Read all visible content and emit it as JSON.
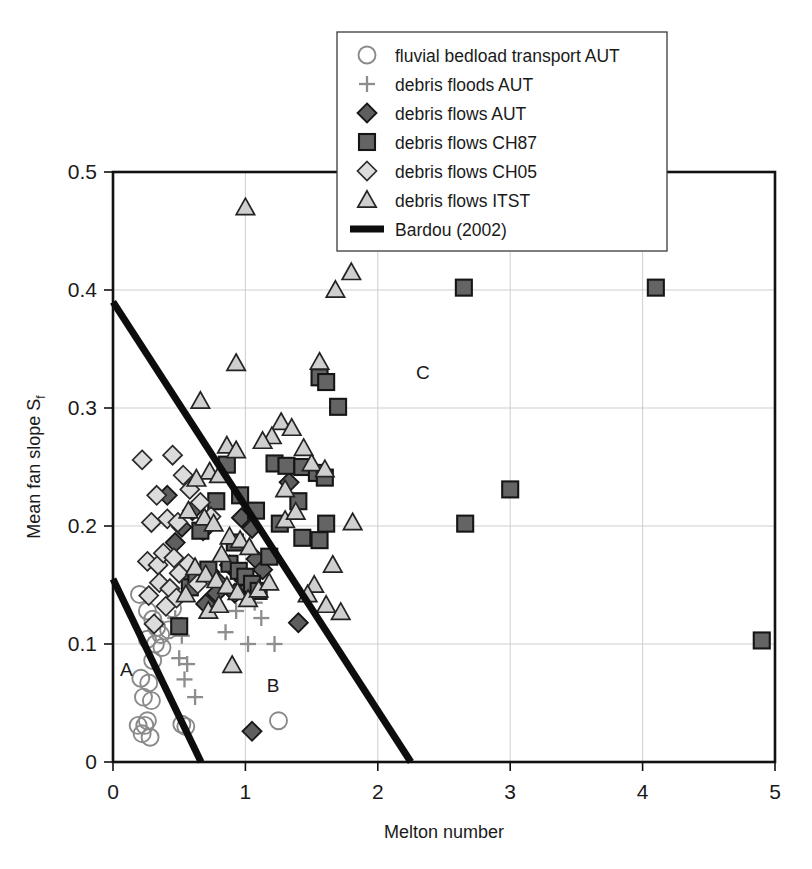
{
  "chart_data": {
    "type": "scatter",
    "title": "",
    "xlabel": "Melton number",
    "ylabel": "Mean fan slope S_f",
    "ylabel_main": "Mean fan slope S",
    "ylabel_sub": "f",
    "xlim": [
      0,
      5
    ],
    "ylim": [
      0,
      0.5
    ],
    "xticks": [
      "0",
      "1",
      "2",
      "3",
      "4",
      "5"
    ],
    "xtick_values": [
      0,
      1,
      2,
      3,
      4,
      5
    ],
    "yticks": [
      "0",
      "0.1",
      "0.2",
      "0.3",
      "0.4",
      "0.5"
    ],
    "ytick_values": [
      0,
      0.1,
      0.2,
      0.3,
      0.4,
      0.5
    ],
    "grid": true,
    "legend_position": "top-center",
    "annotations": [
      {
        "text": "A",
        "x": 0.1,
        "y": 0.073
      },
      {
        "text": "B",
        "x": 1.21,
        "y": 0.059
      },
      {
        "text": "C",
        "x": 2.34,
        "y": 0.325
      }
    ],
    "legend": [
      {
        "label": "fluvial bedload transport AUT",
        "marker": "circle-open-gray",
        "series": "fluvial_bedload_AUT"
      },
      {
        "label": "debris floods AUT",
        "marker": "plus-gray",
        "series": "debris_floods_AUT"
      },
      {
        "label": "debris flows AUT",
        "marker": "diamond-dark",
        "series": "debris_flows_AUT"
      },
      {
        "label": "debris flows CH87",
        "marker": "square-dark",
        "series": "debris_flows_CH87"
      },
      {
        "label": "debris flows CH05",
        "marker": "diamond-light",
        "series": "debris_flows_CH05"
      },
      {
        "label": "debris flows ITST",
        "marker": "triangle-light",
        "series": "debris_flows_ITST"
      },
      {
        "label": "Bardou (2002)",
        "marker": "thick-line",
        "series": "bardou_2002"
      }
    ],
    "lines": [
      {
        "name": "Bardou (2002) upper",
        "points": [
          [
            0.0,
            0.39
          ],
          [
            2.25,
            0.0
          ]
        ]
      },
      {
        "name": "Bardou (2002) lower",
        "points": [
          [
            0.0,
            0.155
          ],
          [
            0.665,
            0.0
          ]
        ]
      }
    ],
    "series": [
      {
        "name": "fluvial bedload transport AUT",
        "marker": "circle-open-gray",
        "points": [
          [
            0.2,
            0.142
          ],
          [
            0.26,
            0.128
          ],
          [
            0.3,
            0.121
          ],
          [
            0.33,
            0.114
          ],
          [
            0.36,
            0.108
          ],
          [
            0.26,
            0.104
          ],
          [
            0.32,
            0.1
          ],
          [
            0.37,
            0.097
          ],
          [
            0.3,
            0.086
          ],
          [
            0.21,
            0.071
          ],
          [
            0.27,
            0.067
          ],
          [
            0.23,
            0.055
          ],
          [
            0.29,
            0.052
          ],
          [
            0.19,
            0.031
          ],
          [
            0.24,
            0.031
          ],
          [
            0.26,
            0.035
          ],
          [
            0.22,
            0.024
          ],
          [
            0.28,
            0.021
          ],
          [
            0.52,
            0.032
          ],
          [
            0.55,
            0.03
          ],
          [
            1.25,
            0.035
          ],
          [
            0.42,
            0.112
          ],
          [
            0.45,
            0.13
          ]
        ]
      },
      {
        "name": "debris floods AUT",
        "marker": "plus-gray",
        "points": [
          [
            0.47,
            0.122
          ],
          [
            0.52,
            0.107
          ],
          [
            0.5,
            0.088
          ],
          [
            0.56,
            0.083
          ],
          [
            0.54,
            0.07
          ],
          [
            0.62,
            0.055
          ],
          [
            0.85,
            0.11
          ],
          [
            0.93,
            0.128
          ],
          [
            1.02,
            0.1
          ],
          [
            1.12,
            0.122
          ],
          [
            1.22,
            0.1
          ],
          [
            1.07,
            0.135
          ]
        ]
      },
      {
        "name": "debris flows AUT",
        "marker": "diamond-dark",
        "points": [
          [
            0.41,
            0.226
          ],
          [
            0.47,
            0.186
          ],
          [
            0.55,
            0.161
          ],
          [
            0.62,
            0.152
          ],
          [
            0.52,
            0.199
          ],
          [
            0.6,
            0.213
          ],
          [
            0.68,
            0.196
          ],
          [
            0.73,
            0.161
          ],
          [
            0.8,
            0.152
          ],
          [
            0.88,
            0.167
          ],
          [
            0.95,
            0.16
          ],
          [
            0.99,
            0.154
          ],
          [
            1.03,
            0.148
          ],
          [
            0.92,
            0.143
          ],
          [
            1.08,
            0.172
          ],
          [
            1.13,
            0.163
          ],
          [
            0.97,
            0.207
          ],
          [
            1.05,
            0.198
          ],
          [
            1.33,
            0.237
          ],
          [
            1.4,
            0.118
          ],
          [
            1.05,
            0.026
          ],
          [
            0.7,
            0.134
          ],
          [
            0.78,
            0.143
          ]
        ]
      },
      {
        "name": "debris flows CH87",
        "marker": "square-dark",
        "points": [
          [
            2.66,
            0.202
          ],
          [
            3.0,
            0.231
          ],
          [
            4.9,
            0.103
          ],
          [
            4.1,
            0.402
          ],
          [
            2.65,
            0.402
          ],
          [
            1.7,
            0.301
          ],
          [
            1.4,
            0.221
          ],
          [
            1.56,
            0.326
          ],
          [
            1.61,
            0.322
          ],
          [
            1.22,
            0.253
          ],
          [
            1.31,
            0.251
          ],
          [
            1.43,
            0.25
          ],
          [
            1.54,
            0.245
          ],
          [
            1.6,
            0.241
          ],
          [
            1.26,
            0.202
          ],
          [
            1.43,
            0.19
          ],
          [
            1.56,
            0.188
          ],
          [
            1.61,
            0.202
          ],
          [
            0.86,
            0.252
          ],
          [
            0.78,
            0.221
          ],
          [
            0.66,
            0.196
          ],
          [
            0.58,
            0.148
          ],
          [
            0.5,
            0.115
          ],
          [
            0.63,
            0.158
          ],
          [
            0.72,
            0.163
          ],
          [
            0.88,
            0.168
          ],
          [
            0.95,
            0.162
          ],
          [
            1.0,
            0.157
          ],
          [
            1.05,
            0.151
          ],
          [
            1.1,
            0.145
          ],
          [
            0.92,
            0.186
          ],
          [
            1.18,
            0.174
          ],
          [
            1.08,
            0.213
          ],
          [
            0.96,
            0.226
          ]
        ]
      },
      {
        "name": "debris flows CH05",
        "marker": "diamond-light",
        "points": [
          [
            0.22,
            0.256
          ],
          [
            0.33,
            0.226
          ],
          [
            0.29,
            0.203
          ],
          [
            0.26,
            0.17
          ],
          [
            0.34,
            0.167
          ],
          [
            0.27,
            0.141
          ],
          [
            0.45,
            0.26
          ],
          [
            0.53,
            0.243
          ],
          [
            0.41,
            0.206
          ],
          [
            0.49,
            0.203
          ],
          [
            0.38,
            0.177
          ],
          [
            0.46,
            0.173
          ],
          [
            0.35,
            0.152
          ],
          [
            0.43,
            0.147
          ],
          [
            0.31,
            0.117
          ],
          [
            0.58,
            0.231
          ],
          [
            0.66,
            0.22
          ],
          [
            0.74,
            0.208
          ],
          [
            0.5,
            0.16
          ],
          [
            0.57,
            0.168
          ],
          [
            0.64,
            0.151
          ],
          [
            0.4,
            0.132
          ],
          [
            0.48,
            0.139
          ]
        ]
      },
      {
        "name": "debris flows ITST",
        "marker": "triangle-light",
        "points": [
          [
            1.0,
            0.47
          ],
          [
            1.8,
            0.415
          ],
          [
            1.68,
            0.4
          ],
          [
            0.93,
            0.338
          ],
          [
            0.66,
            0.306
          ],
          [
            1.56,
            0.339
          ],
          [
            1.27,
            0.288
          ],
          [
            1.35,
            0.283
          ],
          [
            1.2,
            0.276
          ],
          [
            1.13,
            0.272
          ],
          [
            1.44,
            0.266
          ],
          [
            0.86,
            0.268
          ],
          [
            0.93,
            0.264
          ],
          [
            1.5,
            0.253
          ],
          [
            1.6,
            0.248
          ],
          [
            0.73,
            0.246
          ],
          [
            0.8,
            0.243
          ],
          [
            0.63,
            0.24
          ],
          [
            1.3,
            0.231
          ],
          [
            0.57,
            0.213
          ],
          [
            0.69,
            0.207
          ],
          [
            0.76,
            0.202
          ],
          [
            1.81,
            0.203
          ],
          [
            1.66,
            0.167
          ],
          [
            1.52,
            0.15
          ],
          [
            1.47,
            0.142
          ],
          [
            1.61,
            0.133
          ],
          [
            1.72,
            0.127
          ],
          [
            0.88,
            0.191
          ],
          [
            0.96,
            0.188
          ],
          [
            1.03,
            0.182
          ],
          [
            0.82,
            0.176
          ],
          [
            0.62,
            0.165
          ],
          [
            0.7,
            0.159
          ],
          [
            0.78,
            0.154
          ],
          [
            0.86,
            0.149
          ],
          [
            0.94,
            0.144
          ],
          [
            1.02,
            0.138
          ],
          [
            1.1,
            0.146
          ],
          [
            1.18,
            0.152
          ],
          [
            0.55,
            0.142
          ],
          [
            0.9,
            0.082
          ],
          [
            1.3,
            0.205
          ],
          [
            1.38,
            0.212
          ],
          [
            0.72,
            0.128
          ],
          [
            0.8,
            0.133
          ]
        ]
      }
    ]
  }
}
